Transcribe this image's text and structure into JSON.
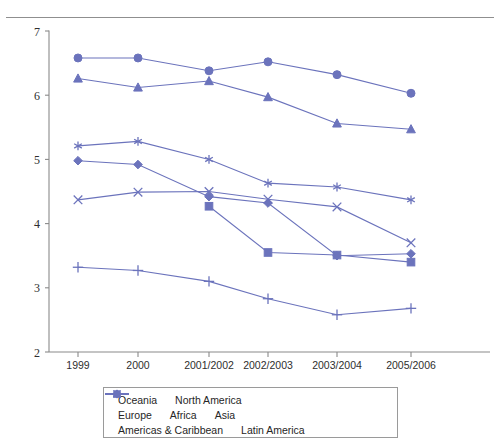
{
  "page": {
    "clipped_header_text": "",
    "background": "#ffffff",
    "accent_color": "#6b73bc"
  },
  "chart_data": {
    "type": "line",
    "title": "",
    "subtitle": "",
    "xlabel": "",
    "ylabel": "",
    "grid": false,
    "legend_position": "bottom",
    "categories": [
      "1999",
      "2000",
      "2001/2002",
      "2002/2003",
      "2003/2004",
      "2005/2006"
    ],
    "ylim": [
      2,
      7
    ],
    "yticks": [
      2,
      3,
      4,
      5,
      6,
      7
    ],
    "ytick_labels": [
      "2",
      "3",
      "4",
      "5",
      "6",
      "7"
    ],
    "series": [
      {
        "name": "Oceania",
        "marker": "circle",
        "color": "#6b73bc",
        "values": [
          6.58,
          6.58,
          6.38,
          6.52,
          6.32,
          6.03
        ]
      },
      {
        "name": "North America",
        "marker": "triangle",
        "color": "#6b73bc",
        "values": [
          6.26,
          6.12,
          6.22,
          5.97,
          5.56,
          5.47
        ]
      },
      {
        "name": "Europe",
        "marker": "asterisk",
        "color": "#6b73bc",
        "values": [
          5.21,
          5.28,
          5.0,
          4.63,
          4.57,
          4.37
        ]
      },
      {
        "name": "Africa",
        "marker": "diamond",
        "color": "#6b73bc",
        "values": [
          4.98,
          4.92,
          4.42,
          4.32,
          3.5,
          3.53
        ]
      },
      {
        "name": "Asia",
        "marker": "cross-x",
        "color": "#6b73bc",
        "values": [
          4.37,
          4.49,
          4.5,
          4.38,
          4.26,
          3.7
        ]
      },
      {
        "name": "Americas & Caribbean",
        "marker": "square",
        "color": "#6b73bc",
        "values": [
          null,
          null,
          4.27,
          3.55,
          3.51,
          3.4
        ]
      },
      {
        "name": "Latin America",
        "marker": "plus",
        "color": "#6b73bc",
        "values": [
          3.32,
          3.27,
          3.1,
          2.83,
          2.58,
          2.68
        ]
      }
    ]
  },
  "legend": {
    "rows": [
      [
        {
          "label": "Oceania",
          "marker": "circle"
        },
        {
          "label": "North America",
          "marker": "triangle"
        }
      ],
      [
        {
          "label": "Europe",
          "marker": "asterisk"
        },
        {
          "label": "Africa",
          "marker": "diamond"
        },
        {
          "label": "Asia",
          "marker": "cross-x"
        }
      ],
      [
        {
          "label": "Americas & Caribbean",
          "marker": "square"
        },
        {
          "label": "Latin America",
          "marker": "plus"
        }
      ]
    ]
  }
}
